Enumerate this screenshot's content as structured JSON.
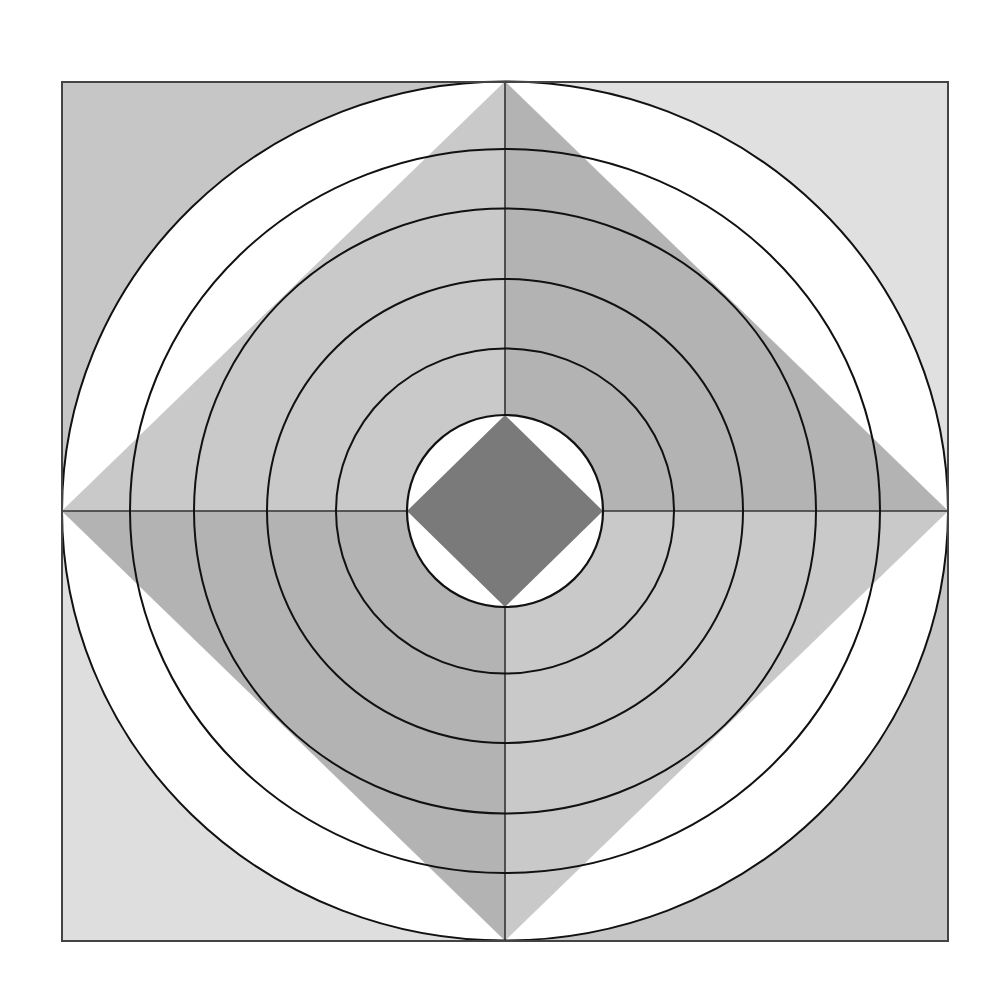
{
  "figure": {
    "type": "geometric-diagram",
    "canvas": {
      "width": 1005,
      "height": 999,
      "background": "#ffffff"
    },
    "square": {
      "x1": 62,
      "y1": 82,
      "x2": 948,
      "y2": 941,
      "stroke": "#444444",
      "stroke_width": 2,
      "corner_fills": {
        "top_left": "#c6c6c6",
        "top_right": "#e0e0e0",
        "bottom_left": "#dedede",
        "bottom_right": "#c6c6c6"
      }
    },
    "center": {
      "cx": 505,
      "cy": 511
    },
    "outer_circle": {
      "rx": 443,
      "ry": 429.5,
      "fill": "#ffffff",
      "stroke": "#111111",
      "stroke_width": 2
    },
    "large_diamond": {
      "quadrant_fills": {
        "top_left": "#c9c9c9",
        "top_right": "#b3b3b3",
        "bottom_left": "#b3b3b3",
        "bottom_right": "#c9c9c9"
      }
    },
    "concentric_circles": [
      {
        "rx": 375,
        "ry": 362
      },
      {
        "rx": 311,
        "ry": 302.5
      },
      {
        "rx": 238,
        "ry": 232
      },
      {
        "rx": 169,
        "ry": 162.5
      }
    ],
    "circle_stroke": "#111111",
    "circle_stroke_width": 2,
    "inner_circle": {
      "rx": 98,
      "ry": 96,
      "fill": "#ffffff",
      "stroke": "#111111",
      "stroke_width": 2.2
    },
    "inner_diamond": {
      "fill": "#7a7a7a"
    },
    "axis_lines": {
      "stroke": "#333333",
      "stroke_width": 1.6
    }
  }
}
